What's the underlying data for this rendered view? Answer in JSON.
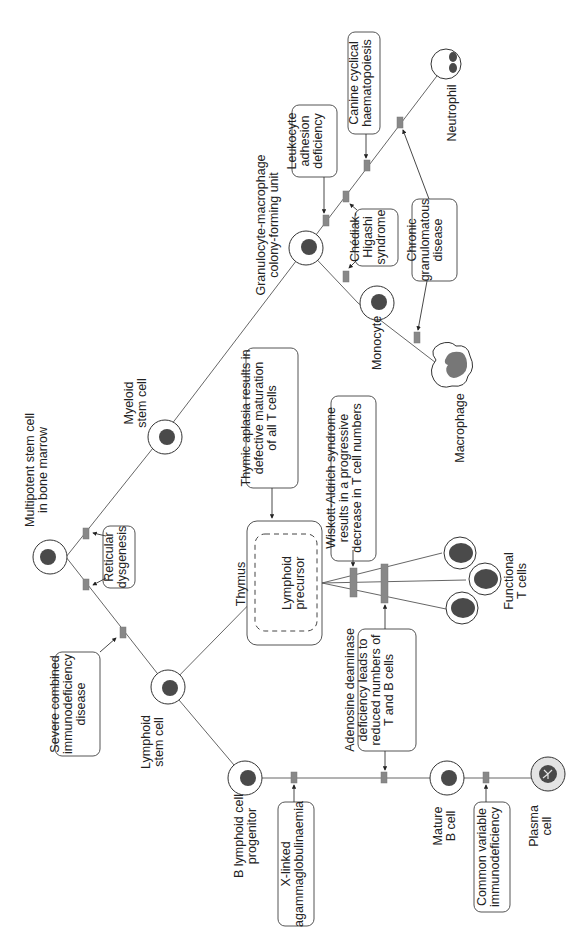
{
  "cells": {
    "multipotent": "Multipotent stem cell\nin bone marrow",
    "myeloid": "Myeloid\nstem cell",
    "gm_cfu": "Granulocyte-macrophage\ncolony-forming unit",
    "monocyte": "Monocyte",
    "macrophage": "Macrophage",
    "neutrophil": "Neutrophil",
    "lymphoid": "Lymphoid\nstem cell",
    "thymus": "Thymus",
    "lymphoid_precursor": "Lymphoid\nprecursor",
    "functional_t": "Functional\nT cells",
    "b_progenitor": "B lymphoid cell\nprogenitor",
    "mature_b": "Mature\nB cell",
    "plasma": "Plasma\ncell"
  },
  "disorders": {
    "reticular": "Reticular\ndysgenesis",
    "scid": "Severe combined\nimmunodeficiency\ndisease",
    "lad": "Leukocyte\nadhesion\ndeficiency",
    "canine": "Canine cyclical\nhaematopoiesis",
    "chediak": "Chédiak-\nHigashi\nsyndrome",
    "cgd": "Chronic\ngranulomatous\ndisease",
    "thymic": "Thymic aplasia results in\ndefective maturation\nof all T cells",
    "wiskott": "Wiskott-Aldrich syndrome\nresults in a progressive\ndecrease in T cell numbers",
    "ada": "Adenosine deaminase\ndeficiency leads to\nreduced numbers of\nT and B cells",
    "xla": "X-linked\nagammaglobulinaemia",
    "cvid": "Common variable\nimmunodeficiency"
  },
  "colors": {
    "block": "#888888",
    "nucleus": "#4a4a4a",
    "line": "#555555"
  }
}
